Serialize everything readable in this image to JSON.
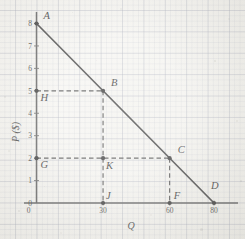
{
  "chart_data": {
    "type": "line",
    "title": "",
    "xlabel": "Q",
    "ylabel": "P ($)",
    "xlim": [
      0,
      90
    ],
    "ylim": [
      0,
      8.6
    ],
    "grid": true,
    "legend": "none",
    "series": [
      {
        "name": "demand-line",
        "x": [
          0,
          80
        ],
        "y": [
          8,
          0
        ],
        "style": "solid",
        "color": "#2a2a2a"
      }
    ],
    "x_ticks": [
      {
        "value": 0,
        "label": "0"
      },
      {
        "value": 30,
        "label": "30"
      },
      {
        "value": 60,
        "label": "60"
      },
      {
        "value": 80,
        "label": "80"
      }
    ],
    "y_ticks": [
      {
        "value": 0,
        "label": "0"
      },
      {
        "value": 1,
        "label": "1"
      },
      {
        "value": 2,
        "label": "2"
      },
      {
        "value": 3,
        "label": "3"
      },
      {
        "value": 4,
        "label": "4"
      },
      {
        "value": 5,
        "label": "5"
      },
      {
        "value": 6,
        "label": "6"
      },
      {
        "value": 7,
        "label": "7"
      },
      {
        "value": 8,
        "label": "8"
      }
    ],
    "points": [
      {
        "label": "A",
        "x": 0,
        "y": 8,
        "marker": true,
        "label_dx": 7,
        "label_dy": -5
      },
      {
        "label": "B",
        "x": 30,
        "y": 5,
        "marker": true,
        "label_dx": 8,
        "label_dy": -5
      },
      {
        "label": "C",
        "x": 60,
        "y": 2,
        "marker": true,
        "label_dx": 8,
        "label_dy": -5
      },
      {
        "label": "D",
        "x": 80,
        "y": 0,
        "marker": true,
        "label_dx": -3,
        "label_dy": -14
      },
      {
        "label": "H",
        "x": 0,
        "y": 5,
        "marker": true,
        "label_dx": 4,
        "label_dy": 10
      },
      {
        "label": "G",
        "x": 0,
        "y": 2,
        "marker": true,
        "label_dx": 4,
        "label_dy": 10
      },
      {
        "label": "K",
        "x": 30,
        "y": 2,
        "marker": true,
        "label_dx": 3,
        "label_dy": 11
      },
      {
        "label": "J",
        "x": 30,
        "y": 0,
        "marker": true,
        "label_dx": 3,
        "label_dy": -4
      },
      {
        "label": "F",
        "x": 60,
        "y": 0,
        "marker": true,
        "label_dx": 4,
        "label_dy": -4
      }
    ],
    "guide_lines": [
      {
        "name": "H-to-B",
        "from": {
          "x": 0,
          "y": 5
        },
        "to": {
          "x": 30,
          "y": 5
        },
        "style": "dashed"
      },
      {
        "name": "B-to-J",
        "from": {
          "x": 30,
          "y": 5
        },
        "to": {
          "x": 30,
          "y": 0
        },
        "style": "dashed"
      },
      {
        "name": "G-to-C",
        "from": {
          "x": 0,
          "y": 2
        },
        "to": {
          "x": 60,
          "y": 2
        },
        "style": "dashed"
      },
      {
        "name": "C-to-F",
        "from": {
          "x": 60,
          "y": 2
        },
        "to": {
          "x": 60,
          "y": 0
        },
        "style": "dashed"
      }
    ],
    "colors": {
      "line": "#2a2a2a",
      "guide": "#3a3a3a",
      "axis": "#4a4a4a",
      "grid_major": "#9aa0b0",
      "grid_minor": "#a8adbc",
      "paper": "#f3f2ee",
      "text": "#1d1d1d"
    }
  }
}
